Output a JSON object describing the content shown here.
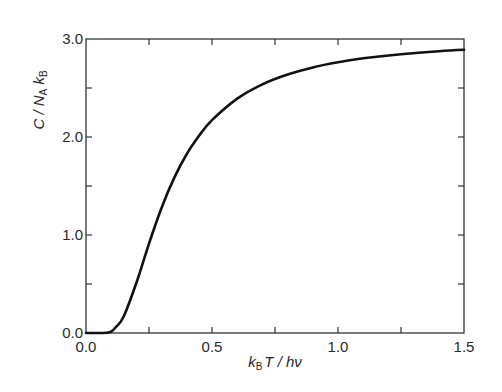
{
  "chart_data": {
    "type": "line",
    "title": "",
    "xlabel": "k_B T / hν",
    "ylabel": "C / N_A k_B",
    "xlabel_parts": {
      "k": "k",
      "sub": "B",
      "rest": "T / hν"
    },
    "ylabel_parts": {
      "pre": "C / N",
      "sub1": "A",
      "k": " k",
      "sub2": "B"
    },
    "xlim": [
      0.0,
      1.5
    ],
    "ylim": [
      0.0,
      3.0
    ],
    "grid": false,
    "legend": "none",
    "x_ticks_major": [
      0.0,
      0.5,
      1.0,
      1.5
    ],
    "x_tick_labels": [
      "0.0",
      "0.5",
      "1.0",
      "1.5"
    ],
    "x_ticks_minor": [
      0.25,
      0.75,
      1.25
    ],
    "y_ticks_major": [
      0.0,
      1.0,
      2.0,
      3.0
    ],
    "y_tick_labels": [
      "0.0",
      "1.0",
      "2.0",
      "3.0"
    ],
    "y_ticks_minor": [
      0.5,
      1.5,
      2.5
    ],
    "series": [
      {
        "name": "Einstein heat capacity",
        "color": "#111111",
        "x": [
          0.0,
          0.05,
          0.08,
          0.1,
          0.12,
          0.15,
          0.2,
          0.25,
          0.3,
          0.35,
          0.4,
          0.45,
          0.5,
          0.6,
          0.7,
          0.8,
          0.9,
          1.0,
          1.1,
          1.25,
          1.4,
          1.5
        ],
        "y": [
          0.0,
          0.0,
          0.002,
          0.014,
          0.063,
          0.17,
          0.512,
          0.912,
          1.279,
          1.583,
          1.827,
          2.017,
          2.172,
          2.392,
          2.538,
          2.638,
          2.71,
          2.762,
          2.803,
          2.845,
          2.876,
          2.891
        ]
      }
    ]
  }
}
